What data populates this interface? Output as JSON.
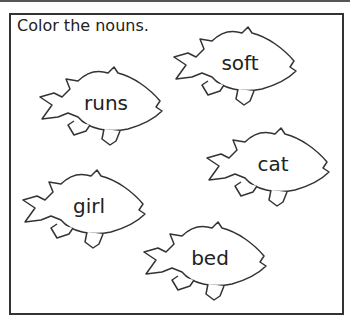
{
  "worksheet": {
    "instruction": "Color the nouns.",
    "fish": [
      {
        "word": "soft",
        "is_noun": false
      },
      {
        "word": "runs",
        "is_noun": false
      },
      {
        "word": "cat",
        "is_noun": true
      },
      {
        "word": "girl",
        "is_noun": true
      },
      {
        "word": "bed",
        "is_noun": true
      }
    ]
  },
  "colors": {
    "outline": "#333333",
    "text": "#222222",
    "background": "#ffffff"
  }
}
